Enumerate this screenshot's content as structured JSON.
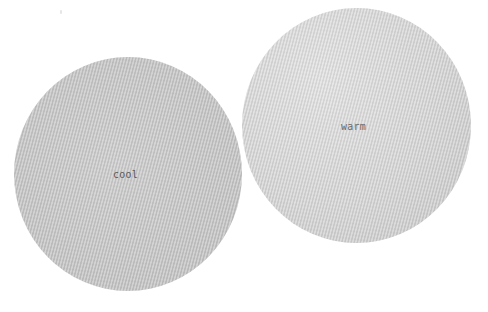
{
  "swatches": [
    {
      "id": "cool",
      "label": "cool",
      "base_color": "#c6c6c6",
      "texture": "fine diagonal stripes"
    },
    {
      "id": "warm",
      "label": "warm",
      "base_color": "#d6d6d6",
      "texture": "fine diagonal stripes"
    }
  ],
  "colors": {
    "background": "#ffffff",
    "label_text": "#5a5a5a"
  }
}
